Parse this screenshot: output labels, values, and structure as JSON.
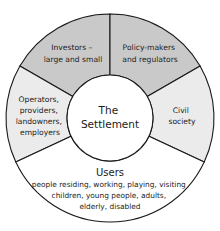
{
  "diagram": {
    "center": {
      "lines": [
        "The",
        "Settlement"
      ]
    },
    "segments": [
      {
        "id": "investors",
        "lines": [
          "Investors –",
          "large and small"
        ],
        "fill": "#c9c9c9"
      },
      {
        "id": "policy-makers",
        "lines": [
          "Policy-makers",
          "and regulators"
        ],
        "fill": "#c9c9c9"
      },
      {
        "id": "operators",
        "lines": [
          "Operators,",
          "providers,",
          "landowners,",
          "employers"
        ],
        "fill": "#ebebeb"
      },
      {
        "id": "civil-society",
        "lines": [
          "Civil",
          "society"
        ],
        "fill": "#ebebeb"
      },
      {
        "id": "users",
        "title": "Users",
        "lines": [
          "people residing, working, playing, visiting",
          "children, young people, adults,",
          "elderly, disabled"
        ],
        "fill": "#ffffff"
      }
    ],
    "colors": {
      "stroke": "#1a1a1a",
      "dark_segment": "#c9c9c9",
      "light_segment": "#ebebeb",
      "white_segment": "#ffffff"
    }
  }
}
